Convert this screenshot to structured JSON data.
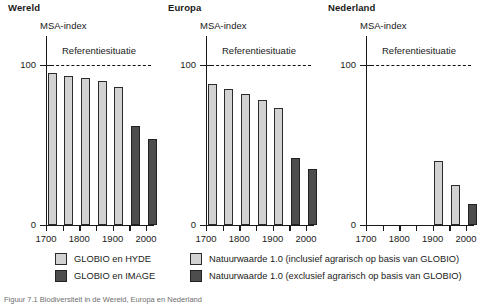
{
  "figure": {
    "caption": "Figuur 7.1 Biodiversiteit in de Wereld, Europa en Nederland"
  },
  "axis": {
    "y_title": "MSA-index",
    "y_label_100": "100",
    "y_label_0": "0",
    "reference_label": "Referentiesituatie",
    "x_tick_labels": [
      "1700",
      "1800",
      "1900",
      "2000"
    ]
  },
  "legend": {
    "items": [
      {
        "label": "GLOBIO en HYDE",
        "color": "#d2d2d2",
        "style": "light"
      },
      {
        "label": "GLOBIO en IMAGE",
        "color": "#4d4d4d",
        "style": "dark"
      },
      {
        "label": "Natuurwaarde 1.0 (inclusief agrarisch op basis van GLOBIO)",
        "color": "#d2d2d2",
        "style": "light"
      },
      {
        "label": "Natuurwaarde 1.0 (exclusief agrarisch op basis van GLOBIO)",
        "color": "#4d4d4d",
        "style": "dark"
      }
    ]
  },
  "chart_data": [
    {
      "type": "bar",
      "title": "Wereld",
      "xlabel": "",
      "ylabel": "MSA-index",
      "ylim": [
        0,
        100
      ],
      "grid": false,
      "reference_line": {
        "value": 100,
        "label": "Referentiesituatie",
        "style": "dashed"
      },
      "x_ticks": [
        1700,
        1750,
        1800,
        1850,
        1900,
        1950,
        2000
      ],
      "x_tick_labels": [
        "1700",
        "",
        "1800",
        "",
        "1900",
        "",
        "2000"
      ],
      "categories": [
        1700,
        1750,
        1800,
        1850,
        1900,
        1950,
        2000
      ],
      "values": [
        95,
        93,
        92,
        90,
        86,
        62,
        54
      ],
      "series_of_bar": [
        "GLOBIO en HYDE",
        "GLOBIO en HYDE",
        "GLOBIO en HYDE",
        "GLOBIO en HYDE",
        "GLOBIO en HYDE",
        "GLOBIO en IMAGE",
        "GLOBIO en IMAGE"
      ],
      "bar_styles": [
        "light",
        "light",
        "light",
        "light",
        "light",
        "dark",
        "dark"
      ]
    },
    {
      "type": "bar",
      "title": "Europa",
      "xlabel": "",
      "ylabel": "MSA-index",
      "ylim": [
        0,
        100
      ],
      "grid": false,
      "reference_line": {
        "value": 100,
        "label": "Referentiesituatie",
        "style": "dashed"
      },
      "x_ticks": [
        1700,
        1750,
        1800,
        1850,
        1900,
        1950,
        2000
      ],
      "x_tick_labels": [
        "1700",
        "",
        "1800",
        "",
        "1900",
        "",
        "2000"
      ],
      "categories": [
        1700,
        1750,
        1800,
        1850,
        1900,
        1950,
        2000
      ],
      "values": [
        88,
        85,
        82,
        78,
        73,
        42,
        35
      ],
      "series_of_bar": [
        "GLOBIO en HYDE",
        "GLOBIO en HYDE",
        "GLOBIO en HYDE",
        "GLOBIO en HYDE",
        "GLOBIO en HYDE",
        "GLOBIO en IMAGE",
        "GLOBIO en IMAGE"
      ],
      "bar_styles": [
        "light",
        "light",
        "light",
        "light",
        "light",
        "dark",
        "dark"
      ]
    },
    {
      "type": "bar",
      "title": "Nederland",
      "xlabel": "",
      "ylabel": "MSA-index",
      "ylim": [
        0,
        100
      ],
      "grid": false,
      "reference_line": {
        "value": 100,
        "label": "Referentiesituatie",
        "style": "dashed"
      },
      "x_ticks": [
        1700,
        1750,
        1800,
        1850,
        1900,
        1950,
        2000
      ],
      "x_tick_labels": [
        "1700",
        "",
        "1800",
        "",
        "1900",
        "",
        "2000"
      ],
      "categories": [
        1900,
        1950,
        2000
      ],
      "values": [
        40,
        25,
        13
      ],
      "series_of_bar": [
        "Natuurwaarde 1.0 (inclusief agrarisch op basis van GLOBIO)",
        "Natuurwaarde 1.0 (inclusief agrarisch op basis van GLOBIO)",
        "Natuurwaarde 1.0 (exclusief agrarisch op basis van GLOBIO)"
      ],
      "bar_styles": [
        "light",
        "light",
        "dark"
      ]
    }
  ]
}
